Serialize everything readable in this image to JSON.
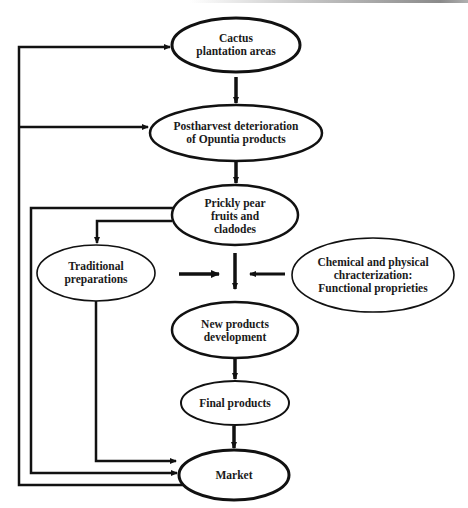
{
  "diagram": {
    "type": "flowchart",
    "nodes": {
      "cactus": {
        "line1": "Cactus",
        "line2": "plantation areas"
      },
      "postharvest": {
        "line1": "Postharvest deterioration",
        "line2": "of Opuntia products"
      },
      "prickly": {
        "line1": "Prickly pear",
        "line2": "fruits and",
        "line3": "cladodes"
      },
      "traditional": {
        "line1": "Traditional",
        "line2": "preparations"
      },
      "chemical": {
        "line1": "Chemical and physical",
        "line2": "chracterization:",
        "line3": "Functional proprieties"
      },
      "new_products": {
        "line1": "New products",
        "line2": "development"
      },
      "final": {
        "line1": "Final products"
      },
      "market": {
        "line1": "Market"
      }
    },
    "edges": [
      {
        "from": "Cactus plantation areas",
        "to": "Postharvest deterioration of Opuntia products"
      },
      {
        "from": "Postharvest deterioration of Opuntia products",
        "to": "Prickly pear fruits and cladodes"
      },
      {
        "from": "Prickly pear fruits and cladodes",
        "to": "Traditional preparations"
      },
      {
        "from": "Prickly pear fruits and cladodes",
        "to": "Market"
      },
      {
        "from": "Prickly pear fruits and cladodes",
        "to": "New products development"
      },
      {
        "from": "Traditional preparations",
        "to": "New products development"
      },
      {
        "from": "Chemical and physical chracterization: Functional proprieties",
        "to": "New products development"
      },
      {
        "from": "Traditional preparations",
        "to": "Market"
      },
      {
        "from": "New products development",
        "to": "Final products"
      },
      {
        "from": "Final products",
        "to": "Market"
      },
      {
        "from": "Market",
        "to": "Cactus plantation areas"
      },
      {
        "from": "Market",
        "to": "Postharvest deterioration of Opuntia products"
      }
    ],
    "colors": {
      "stroke": "#111111",
      "background": "#ffffff"
    }
  }
}
